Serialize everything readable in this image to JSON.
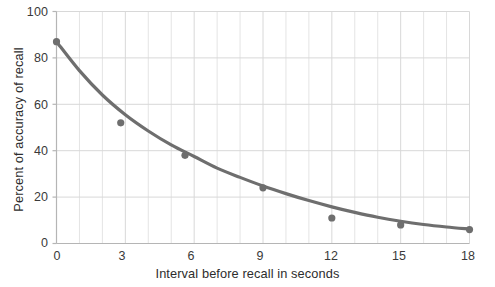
{
  "chart_data": {
    "type": "scatter",
    "title": "",
    "xlabel": "Interval before recall in seconds",
    "ylabel": "Percent of accuracy of recall",
    "xlim": [
      0,
      18
    ],
    "ylim": [
      0,
      100
    ],
    "xticks": [
      0,
      3,
      6,
      9,
      12,
      15,
      18
    ],
    "yticks": [
      0,
      20,
      40,
      60,
      80,
      100
    ],
    "xtick_labels": [
      "0",
      "3",
      "6",
      "9",
      "12",
      "15",
      "18"
    ],
    "ytick_labels": [
      "0",
      "20",
      "40",
      "60",
      "80",
      "100"
    ],
    "grid": true,
    "grid_minor_x_step": 1,
    "legend": "none",
    "point_color": "#6e6e6e",
    "line_color": "#6e6e6e",
    "grid_color": "#d8d8d8",
    "axis_color": "#b5b5b5",
    "x": [
      0,
      2.8,
      5.6,
      9.0,
      12.0,
      15.0,
      18.0
    ],
    "values": [
      87,
      52,
      38,
      24,
      11,
      8,
      6
    ],
    "points": [
      {
        "x": 0.0,
        "y": 87
      },
      {
        "x": 2.8,
        "y": 52
      },
      {
        "x": 5.6,
        "y": 38
      },
      {
        "x": 9.0,
        "y": 24
      },
      {
        "x": 12.0,
        "y": 11
      },
      {
        "x": 15.0,
        "y": 8
      },
      {
        "x": 18.0,
        "y": 6
      }
    ],
    "fit_curve": {
      "description": "smooth exponential decay trend line through points",
      "x": [
        0,
        1,
        2,
        3,
        4,
        5,
        6,
        7,
        8,
        9,
        10,
        11,
        12,
        13,
        14,
        15,
        16,
        17,
        18
      ],
      "y": [
        87,
        74.5,
        64,
        55.5,
        48.5,
        42.5,
        37.5,
        32.5,
        28.5,
        24.8,
        21.5,
        18.5,
        15.8,
        13.4,
        11.3,
        9.6,
        8.2,
        7.1,
        6.2
      ]
    }
  }
}
